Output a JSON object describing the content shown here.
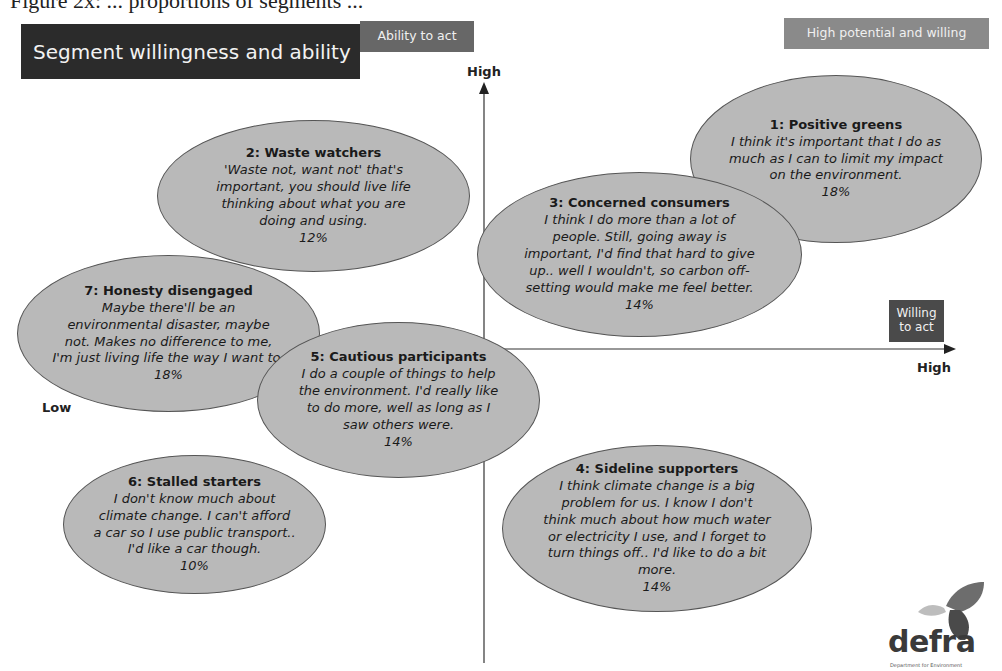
{
  "caption_fragment": "Figure 2x: ... proportions of segments ...",
  "header": {
    "title": "Segment willingness and ability",
    "ability_tag": "Ability to act",
    "high_potential_tag": "High potential and willing",
    "willing_tag": "Willing to act"
  },
  "axes": {
    "y_high": "High",
    "x_high": "High",
    "x_low": "Low",
    "y_label": "Ability to act",
    "x_label": "Willing to act"
  },
  "segments": [
    {
      "id": 1,
      "title": "1: Positive greens",
      "quote": "I think it's important that I do as\nmuch as I can to limit my impact\non the environment.",
      "pct": "18%"
    },
    {
      "id": 2,
      "title": "2: Waste watchers",
      "quote": "'Waste not, want not' that's\nimportant, you should live life\nthinking about what you are\ndoing and using.",
      "pct": "12%"
    },
    {
      "id": 3,
      "title": "3: Concerned consumers",
      "quote": "I think I do more than a lot of\npeople. Still, going away is\nimportant, I'd find that hard to give\nup.. well I wouldn't, so carbon off-\nsetting would make me feel better.",
      "pct": "14%"
    },
    {
      "id": 4,
      "title": "4: Sideline supporters",
      "quote": "I think climate change is a big\nproblem for us. I know I don't\nthink much about how much water\nor electricity I use, and I forget to\nturn things off.. I'd like to do a bit\nmore.",
      "pct": "14%"
    },
    {
      "id": 5,
      "title": "5: Cautious participants",
      "quote": "I do a couple of things to help\nthe environment. I'd really like\nto do more, well as long as I\nsaw others were.",
      "pct": "14%"
    },
    {
      "id": 6,
      "title": "6: Stalled starters",
      "quote": "I don't know much about\nclimate change. I can't afford\na car so I use public transport..\nI'd like a car though.",
      "pct": "10%"
    },
    {
      "id": 7,
      "title": "7: Honesty disengaged",
      "quote": "Maybe there'll be an\nenvironmental disaster, maybe\nnot. Makes no difference to me,\nI'm just living life the way I want to.",
      "pct": "18%"
    }
  ],
  "logo": {
    "text": "defra",
    "subtext": "Department for Environment"
  },
  "colors": {
    "ellipse_fill": "#b9b9b9",
    "title_bg": "#2b2b2b",
    "tag_bg": "#676767"
  }
}
